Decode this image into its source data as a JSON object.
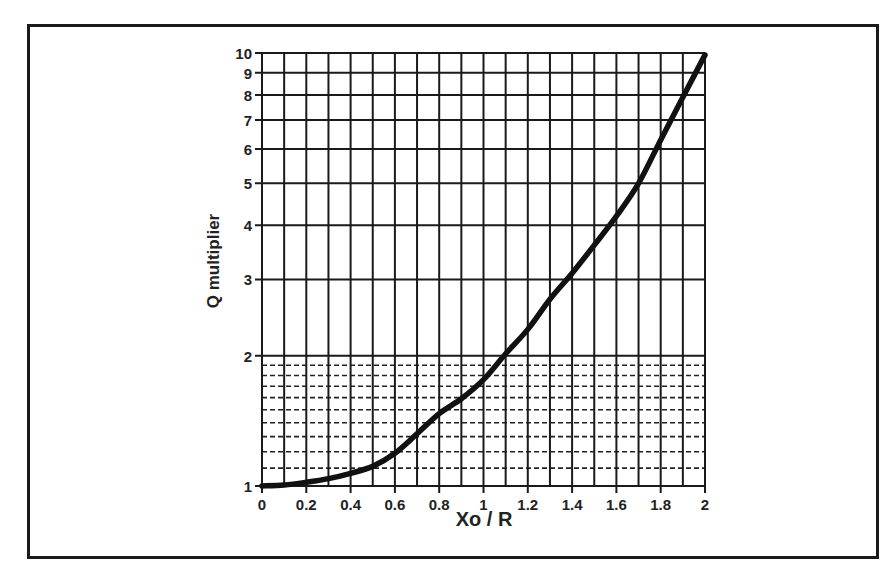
{
  "chart_data": {
    "type": "line",
    "title": "",
    "xlabel": "Xo / R",
    "ylabel": "Q multiplier",
    "xlim": [
      0,
      2
    ],
    "ylim": [
      1,
      10
    ],
    "yscale": "log",
    "grid": true,
    "x_ticks": [
      0,
      0.2,
      0.4,
      0.6,
      0.8,
      1,
      1.2,
      1.4,
      1.6,
      1.8,
      2
    ],
    "x_tick_labels": [
      "0",
      "0.2",
      "0.4",
      "0.6",
      "0.8",
      "1",
      "1.2",
      "1.4",
      "1.6",
      "1.8",
      "2"
    ],
    "x_minor_grid": [
      0.1,
      0.3,
      0.5,
      0.7,
      0.9,
      1.1,
      1.3,
      1.5,
      1.7,
      1.9
    ],
    "y_ticks": [
      1,
      2,
      3,
      4,
      5,
      6,
      7,
      8,
      9,
      10
    ],
    "y_tick_labels": [
      "1",
      "2",
      "3",
      "4",
      "5",
      "6",
      "7",
      "8",
      "9",
      "10"
    ],
    "y_minor_grid_dashed": [
      1.1,
      1.2,
      1.3,
      1.4,
      1.5,
      1.6,
      1.7,
      1.8,
      1.9
    ],
    "legend": "none",
    "series": [
      {
        "name": "Q multiplier",
        "color": "#111111",
        "x": [
          0,
          0.1,
          0.2,
          0.3,
          0.4,
          0.5,
          0.6,
          0.7,
          0.8,
          0.9,
          1.0,
          1.1,
          1.2,
          1.3,
          1.4,
          1.5,
          1.6,
          1.7,
          1.8,
          1.9,
          2.0
        ],
        "y": [
          1.0,
          1.005,
          1.02,
          1.04,
          1.07,
          1.11,
          1.19,
          1.32,
          1.47,
          1.59,
          1.76,
          2.02,
          2.3,
          2.7,
          3.1,
          3.6,
          4.2,
          5.0,
          6.3,
          7.9,
          9.9
        ]
      }
    ]
  }
}
